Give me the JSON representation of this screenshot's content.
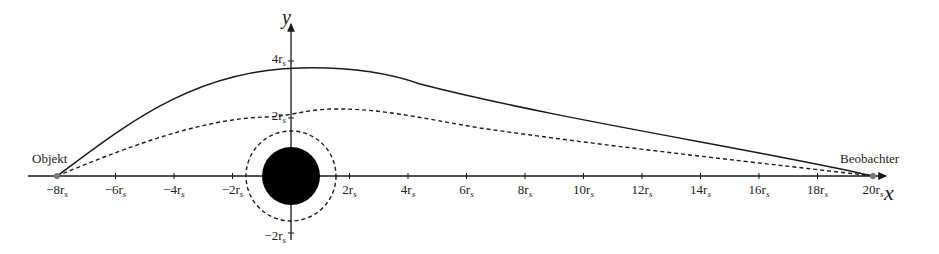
{
  "diagram": {
    "axes": {
      "x_label": "x",
      "y_label": "y",
      "x_ticks": [
        "−8r",
        "−6r",
        "−4r",
        "−2r",
        "2r",
        "4r",
        "6r",
        "8r",
        "10r",
        "12r",
        "14r",
        "16r",
        "18r",
        "20r"
      ],
      "y_ticks": [
        "4r",
        "2r",
        "−2r"
      ],
      "tick_subscript": "s"
    },
    "labels": {
      "object": "Objekt",
      "observer": "Beobachter"
    },
    "elements": {
      "black_hole": "filled black disk at origin, radius ≈ 1r_s",
      "photon_sphere": "dashed circle at origin, radius ≈ 1.5r_s",
      "path_solid": "solid light path from Objekt (−8r_s) to Beobachter (20r_s), peak ≈ 3.7r_s",
      "path_dashed": "dashed light path from Objekt to Beobachter, tangent near 2r_s, peak ≈ 2.3r_s"
    },
    "colors": {
      "ink": "#1a1a1a",
      "background": "#ffffff",
      "point": "#777777"
    }
  }
}
